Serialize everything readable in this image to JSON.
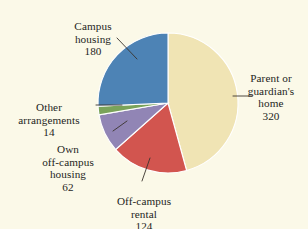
{
  "chart_data": {
    "type": "pie",
    "title": "",
    "subtitle": "",
    "xlabel": "",
    "ylabel": "",
    "legend_position": "callout-labels",
    "grid": false,
    "total": 700,
    "start_angle_deg": 0,
    "direction": "clockwise",
    "categories": [
      "Parent or guardian's home",
      "Off-campus rental",
      "Own off-campus housing",
      "Other arrangements",
      "Campus housing"
    ],
    "values": [
      320,
      124,
      62,
      14,
      180
    ],
    "slices": [
      {
        "label": "Parent or guardian's home",
        "label_lines": "Parent or\nguardian's\nhome",
        "value": 320,
        "value_text": "320",
        "percent": 45.7,
        "angle_deg": 164.6,
        "color": "#f0e4b4"
      },
      {
        "label": "Off-campus rental",
        "label_lines": "Off-campus\nrental",
        "value": 124,
        "value_text": "124",
        "percent": 17.7,
        "angle_deg": 63.8,
        "color": "#d2554f"
      },
      {
        "label": "Own off-campus housing",
        "label_lines": "Own\noff-campus\nhousing",
        "value": 62,
        "value_text": "62",
        "percent": 8.9,
        "angle_deg": 31.9,
        "color": "#9185b5"
      },
      {
        "label": "Other arrangements",
        "label_lines": "Other\narrangements",
        "value": 14,
        "value_text": "14",
        "percent": 2.0,
        "angle_deg": 7.2,
        "color": "#7aa35a"
      },
      {
        "label": "Campus housing",
        "label_lines": "Campus\nhousing",
        "value": 180,
        "value_text": "180",
        "percent": 25.7,
        "angle_deg": 92.6,
        "color": "#4d83b5"
      }
    ],
    "colors": {
      "background": "#fbf9e8",
      "parent_home": "#f0e4b4",
      "off_campus_rental": "#d2554f",
      "own_off_campus": "#9185b5",
      "other_arrangements": "#7aa35a",
      "campus_housing": "#4d83b5",
      "slice_outline": "#ffffff",
      "leader_line": "#3a332c",
      "text": "#241f1c"
    }
  }
}
